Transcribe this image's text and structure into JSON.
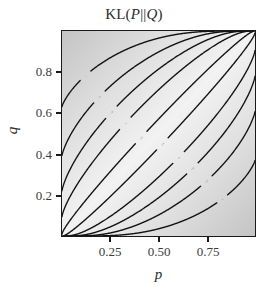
{
  "chart_data": {
    "type": "line",
    "title": "KL(P||Q)",
    "title_parts": {
      "prefix": "KL(",
      "p": "P",
      "sep": "||",
      "q": "Q",
      "suffix": ")"
    },
    "xlabel": "p",
    "ylabel": "q",
    "xlim": [
      0,
      1
    ],
    "ylim": [
      0,
      1
    ],
    "grid": false,
    "legend": "none",
    "xticks": [
      0.25,
      0.5,
      0.75
    ],
    "xticklabels": [
      "0.25",
      "0.50",
      "0.75"
    ],
    "yticks": [
      0.2,
      0.4,
      0.6,
      0.8
    ],
    "yticklabels": [
      "0.2",
      "0.4",
      "0.6",
      "0.8"
    ],
    "plot_kind": "contour",
    "colormap": "grayscale-light",
    "background_note": "shaded gray, darkest at top-left and bottom-right corners, white along p=q diagonal",
    "contour_levels": [
      0.01,
      0.1,
      0.25,
      0.5,
      1
    ],
    "contour_labels_upper": [
      "1",
      "0.5",
      "0.25",
      "0.1",
      "0.01"
    ],
    "contour_labels_lower": [
      "0.01",
      "0.1",
      "0.25",
      "0.5",
      "1"
    ],
    "contour_label_count": 10,
    "annotations": [
      {
        "text": "1",
        "side": "upper"
      },
      {
        "text": "0.5",
        "side": "upper"
      },
      {
        "text": "0.25",
        "side": "upper"
      },
      {
        "text": "0.1",
        "side": "upper"
      },
      {
        "text": "0.01",
        "side": "upper"
      },
      {
        "text": "0.01",
        "side": "lower"
      },
      {
        "text": "0.1",
        "side": "lower"
      },
      {
        "text": "0.25",
        "side": "lower"
      },
      {
        "text": "0.5",
        "side": "lower"
      },
      {
        "text": "1",
        "side": "lower"
      }
    ],
    "series": [
      {
        "name": "KL = 0.01 (upper)",
        "level": 0.01,
        "values": []
      },
      {
        "name": "KL = 0.1 (upper)",
        "level": 0.1,
        "values": []
      },
      {
        "name": "KL = 0.25 (upper)",
        "level": 0.25,
        "values": []
      },
      {
        "name": "KL = 0.5 (upper)",
        "level": 0.5,
        "values": []
      },
      {
        "name": "KL = 1 (upper)",
        "level": 1,
        "values": []
      },
      {
        "name": "KL = 0.01 (lower)",
        "level": 0.01,
        "values": []
      },
      {
        "name": "KL = 0.1 (lower)",
        "level": 0.1,
        "values": []
      },
      {
        "name": "KL = 0.25 (lower)",
        "level": 0.25,
        "values": []
      },
      {
        "name": "KL = 0.5 (lower)",
        "level": 0.5,
        "values": []
      },
      {
        "name": "KL = 1 (lower)",
        "level": 1,
        "values": []
      }
    ],
    "colors": {
      "contour": "#141414",
      "frame": "#1a1a1a",
      "text": "#2b2b2b",
      "tick_text": "#3a3a3a",
      "shade_dark": "#c9c9c9",
      "shade_light": "#ffffff"
    }
  }
}
